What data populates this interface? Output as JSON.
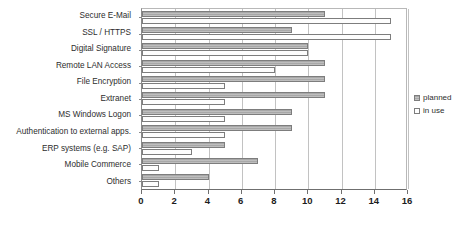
{
  "chart_data": {
    "type": "bar",
    "orientation": "horizontal",
    "title": "",
    "xlabel": "",
    "ylabel": "",
    "xlim": [
      0,
      16
    ],
    "xticks": [
      0,
      2,
      4,
      6,
      8,
      10,
      12,
      14,
      16
    ],
    "grid": true,
    "legend_position": "right",
    "categories": [
      "Secure E-Mail",
      "SSL / HTTPS",
      "Digital Signature",
      "Remote LAN Access",
      "File Encryption",
      "Extranet",
      "MS Windows Logon",
      "Authentication to external apps.",
      "ERP systems (e.g. SAP)",
      "Mobile Commerce",
      "Others"
    ],
    "series": [
      {
        "name": "planned",
        "color": "#a8a8a8",
        "values": [
          11,
          9,
          10,
          11,
          11,
          11,
          9,
          9,
          5,
          7,
          4
        ]
      },
      {
        "name": "in use",
        "color": "#ffffff",
        "values": [
          15,
          15,
          10,
          8,
          5,
          5,
          5,
          5,
          3,
          1,
          1
        ]
      }
    ]
  },
  "legend": {
    "items": [
      {
        "label": "planned"
      },
      {
        "label": "in use"
      }
    ]
  }
}
